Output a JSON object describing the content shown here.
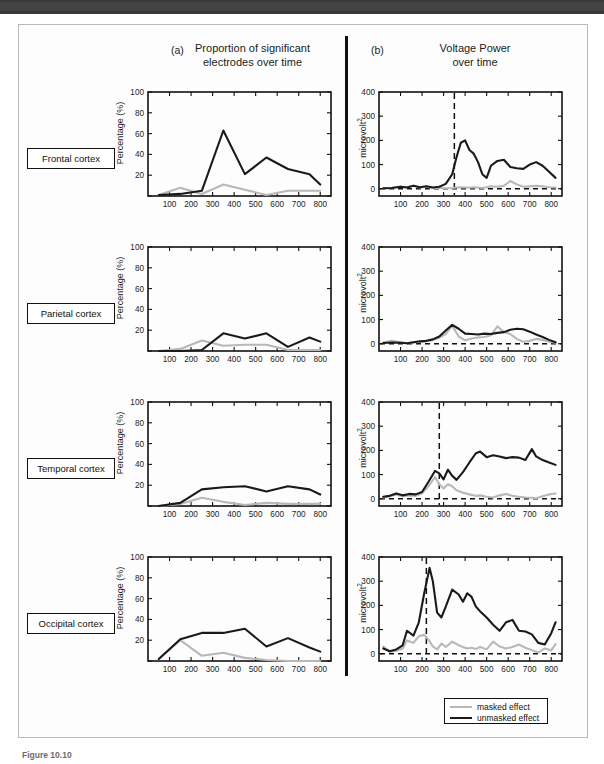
{
  "figure": {
    "caption": "Figure 10.10",
    "colors": {
      "unmasked": "#1a1a1a",
      "masked": "#b8b8b8",
      "axis": "#111111",
      "band": "#3a3a3a"
    }
  },
  "panels": [
    {
      "letter": "(a)",
      "title_line1": "Proportion of significant",
      "title_line2": "electrodes over time",
      "ylabel": "Percentage (%)",
      "ylabel_sup": "",
      "ylim": [
        0,
        100
      ],
      "yticks": [
        0,
        20,
        40,
        60,
        80,
        100
      ],
      "ytick_labels": [
        "",
        "20",
        "40",
        "60",
        "80",
        "100"
      ],
      "xlim": [
        0,
        850
      ],
      "xticks": [
        100,
        200,
        300,
        400,
        500,
        600,
        700,
        800
      ],
      "xtick_labels": [
        "100",
        "200",
        "300",
        "400",
        "500",
        "600",
        "700",
        "800"
      ]
    },
    {
      "letter": "(b)",
      "title_line1": "Voltage Power",
      "title_line2": "over time",
      "ylabel": "microvolt",
      "ylabel_sup": "2",
      "ylim": [
        -30,
        400
      ],
      "yticks": [
        0,
        100,
        200,
        300,
        400
      ],
      "ytick_labels": [
        "0",
        "100",
        "200",
        "300",
        "400"
      ],
      "xlim": [
        0,
        850
      ],
      "xticks": [
        100,
        200,
        300,
        400,
        500,
        600,
        700,
        800
      ],
      "xtick_labels": [
        "100",
        "200",
        "300",
        "400",
        "500",
        "600",
        "700",
        "800"
      ]
    }
  ],
  "rows": [
    {
      "label": "Frontal cortex"
    },
    {
      "label": "Parietal cortex"
    },
    {
      "label": "Temporal cortex"
    },
    {
      "label": "Occipital cortex"
    }
  ],
  "legend": {
    "position": "bottom-right",
    "items": [
      {
        "label": "masked effect",
        "color": "#b8b8b8"
      },
      {
        "label": "unmasked effect",
        "color": "#1a1a1a"
      }
    ]
  },
  "chart_data": [
    {
      "id": "frontal-proportion",
      "type": "line",
      "title": "Proportion of significant electrodes over time",
      "region": "Frontal cortex",
      "panel": "(a)",
      "xlabel": "",
      "ylabel": "Percentage (%)",
      "xlim": [
        0,
        850
      ],
      "ylim": [
        0,
        100
      ],
      "grid": false,
      "legend_position": "external-bottom-right",
      "x": [
        50,
        150,
        250,
        350,
        450,
        550,
        650,
        750,
        800
      ],
      "series": [
        {
          "name": "unmasked effect",
          "color": "#1a1a1a",
          "values": [
            1,
            2,
            5,
            63,
            21,
            37,
            26,
            21,
            11
          ]
        },
        {
          "name": "masked effect",
          "color": "#b8b8b8",
          "values": [
            1,
            8,
            2,
            11,
            6,
            1,
            5,
            5,
            5
          ]
        }
      ],
      "vertical_marker": null
    },
    {
      "id": "frontal-voltage-power",
      "type": "line",
      "title": "Voltage Power over time",
      "region": "Frontal cortex",
      "panel": "(b)",
      "xlabel": "",
      "ylabel": "microvolt^2",
      "xlim": [
        0,
        850
      ],
      "ylim": [
        -30,
        400
      ],
      "grid": false,
      "legend_position": "external-bottom-right",
      "x": [
        20,
        60,
        100,
        130,
        160,
        190,
        220,
        250,
        280,
        310,
        340,
        360,
        380,
        400,
        420,
        440,
        460,
        480,
        500,
        520,
        550,
        580,
        610,
        640,
        670,
        700,
        730,
        760,
        790,
        820
      ],
      "series": [
        {
          "name": "unmasked effect",
          "color": "#1a1a1a",
          "values": [
            2,
            3,
            8,
            5,
            12,
            6,
            10,
            5,
            8,
            20,
            60,
            130,
            190,
            200,
            160,
            145,
            110,
            60,
            45,
            95,
            115,
            120,
            90,
            85,
            82,
            100,
            110,
            95,
            70,
            45
          ]
        },
        {
          "name": "masked effect",
          "color": "#b8b8b8",
          "values": [
            2,
            4,
            9,
            6,
            12,
            5,
            8,
            3,
            4,
            2,
            3,
            5,
            6,
            5,
            4,
            6,
            5,
            3,
            6,
            10,
            8,
            12,
            32,
            18,
            8,
            10,
            12,
            10,
            6,
            5
          ]
        }
      ],
      "vertical_marker": 350,
      "zero_line": 0
    },
    {
      "id": "parietal-proportion",
      "type": "line",
      "title": "Proportion of significant electrodes over time",
      "region": "Parietal cortex",
      "panel": "(a)",
      "xlabel": "",
      "ylabel": "Percentage (%)",
      "xlim": [
        0,
        850
      ],
      "ylim": [
        0,
        100
      ],
      "grid": false,
      "legend_position": "external-bottom-right",
      "x": [
        50,
        150,
        250,
        350,
        450,
        550,
        650,
        750,
        800
      ],
      "series": [
        {
          "name": "unmasked effect",
          "color": "#1a1a1a",
          "values": [
            0,
            0,
            1,
            17,
            12,
            17,
            4,
            13,
            9
          ]
        },
        {
          "name": "masked effect",
          "color": "#b8b8b8",
          "values": [
            0,
            2,
            10,
            5,
            6,
            6,
            1,
            1,
            1
          ]
        }
      ],
      "vertical_marker": null
    },
    {
      "id": "parietal-voltage-power",
      "type": "line",
      "title": "Voltage Power over time",
      "region": "Parietal cortex",
      "panel": "(b)",
      "xlabel": "",
      "ylabel": "microvolt^2",
      "xlim": [
        0,
        850
      ],
      "ylim": [
        -30,
        400
      ],
      "grid": false,
      "legend_position": "external-bottom-right",
      "x": [
        20,
        60,
        100,
        130,
        160,
        190,
        220,
        250,
        280,
        310,
        340,
        370,
        400,
        430,
        460,
        490,
        520,
        550,
        580,
        610,
        640,
        670,
        700,
        730,
        760,
        790,
        820
      ],
      "series": [
        {
          "name": "unmasked effect",
          "color": "#1a1a1a",
          "values": [
            3,
            5,
            4,
            2,
            6,
            10,
            12,
            18,
            30,
            55,
            78,
            62,
            42,
            40,
            38,
            42,
            40,
            45,
            48,
            58,
            62,
            60,
            50,
            38,
            28,
            16,
            6
          ]
        },
        {
          "name": "masked effect",
          "color": "#b8b8b8",
          "values": [
            5,
            12,
            6,
            2,
            5,
            8,
            10,
            15,
            25,
            40,
            75,
            30,
            14,
            22,
            26,
            28,
            35,
            72,
            48,
            40,
            20,
            8,
            12,
            20,
            16,
            8,
            4
          ]
        }
      ],
      "vertical_marker": null,
      "zero_line": 0
    },
    {
      "id": "temporal-proportion",
      "type": "line",
      "title": "Proportion of significant electrodes over time",
      "region": "Temporal cortex",
      "panel": "(a)",
      "xlabel": "",
      "ylabel": "Percentage (%)",
      "xlim": [
        0,
        850
      ],
      "ylim": [
        0,
        100
      ],
      "grid": false,
      "legend_position": "external-bottom-right",
      "x": [
        50,
        150,
        250,
        350,
        450,
        550,
        650,
        750,
        800
      ],
      "series": [
        {
          "name": "unmasked effect",
          "color": "#1a1a1a",
          "values": [
            0,
            3,
            16,
            18,
            19,
            14,
            19,
            16,
            11
          ]
        },
        {
          "name": "masked effect",
          "color": "#b8b8b8",
          "values": [
            0,
            2,
            8,
            4,
            1,
            3,
            2,
            2,
            2
          ]
        }
      ],
      "vertical_marker": null
    },
    {
      "id": "temporal-voltage-power",
      "type": "line",
      "title": "Voltage Power over time",
      "region": "Temporal cortex",
      "panel": "(b)",
      "xlabel": "",
      "ylabel": "microvolt^2",
      "xlim": [
        -30,
        400
      ],
      "ylim": [
        -30,
        400
      ],
      "grid": false,
      "legend_position": "external-bottom-right",
      "x": [
        20,
        50,
        80,
        110,
        140,
        170,
        200,
        230,
        260,
        280,
        300,
        320,
        340,
        360,
        390,
        420,
        450,
        470,
        500,
        530,
        560,
        590,
        620,
        650,
        680,
        710,
        730,
        760,
        790,
        820
      ],
      "series": [
        {
          "name": "unmasked effect",
          "color": "#1a1a1a",
          "values": [
            8,
            12,
            22,
            14,
            20,
            18,
            28,
            70,
            115,
            105,
            80,
            120,
            95,
            78,
            110,
            150,
            188,
            195,
            172,
            180,
            175,
            168,
            172,
            170,
            160,
            205,
            175,
            160,
            150,
            140
          ]
        },
        {
          "name": "masked effect",
          "color": "#b8b8b8",
          "values": [
            5,
            10,
            18,
            10,
            14,
            12,
            22,
            52,
            90,
            60,
            42,
            60,
            52,
            35,
            25,
            18,
            12,
            14,
            8,
            5,
            14,
            20,
            12,
            8,
            5,
            4,
            2,
            10,
            18,
            22
          ]
        }
      ],
      "vertical_marker": 280,
      "zero_line": 0
    },
    {
      "id": "occipital-proportion",
      "type": "line",
      "title": "Proportion of significant electrodes over time",
      "region": "Occipital cortex",
      "panel": "(a)",
      "xlabel": "",
      "ylabel": "Percentage (%)",
      "xlim": [
        0,
        850
      ],
      "ylim": [
        0,
        100
      ],
      "grid": false,
      "legend_position": "external-bottom-right",
      "x": [
        50,
        150,
        250,
        350,
        450,
        550,
        650,
        750,
        800
      ],
      "series": [
        {
          "name": "unmasked effect",
          "color": "#1a1a1a",
          "values": [
            2,
            21,
            27,
            27,
            31,
            14,
            22,
            13,
            9
          ]
        },
        {
          "name": "masked effect",
          "color": "#b8b8b8",
          "values": [
            2,
            20,
            5,
            8,
            3,
            1,
            0,
            0,
            0
          ]
        }
      ],
      "vertical_marker": null
    },
    {
      "id": "occipital-voltage-power",
      "type": "line",
      "title": "Voltage Power over time",
      "region": "Occipital cortex",
      "panel": "(b)",
      "xlabel": "",
      "ylabel": "microvolt^2",
      "xlim": [
        0,
        850
      ],
      "ylim": [
        -30,
        400
      ],
      "grid": false,
      "legend_position": "external-bottom-right",
      "x": [
        20,
        50,
        80,
        110,
        130,
        160,
        185,
        210,
        235,
        250,
        270,
        290,
        310,
        340,
        370,
        390,
        410,
        430,
        450,
        470,
        500,
        530,
        560,
        590,
        620,
        650,
        680,
        710,
        740,
        770,
        800,
        820
      ],
      "series": [
        {
          "name": "unmasked effect",
          "color": "#1a1a1a",
          "values": [
            22,
            10,
            18,
            35,
            95,
            75,
            130,
            250,
            355,
            300,
            170,
            150,
            195,
            265,
            245,
            215,
            250,
            235,
            195,
            175,
            150,
            120,
            95,
            130,
            140,
            95,
            92,
            80,
            45,
            38,
            85,
            130
          ]
        },
        {
          "name": "masked effect",
          "color": "#b8b8b8",
          "values": [
            30,
            8,
            12,
            22,
            55,
            45,
            72,
            78,
            52,
            30,
            18,
            42,
            28,
            50,
            35,
            28,
            22,
            25,
            20,
            28,
            18,
            50,
            30,
            22,
            28,
            38,
            25,
            15,
            5,
            22,
            14,
            40
          ]
        }
      ],
      "vertical_marker": 220,
      "zero_line": 0
    }
  ]
}
